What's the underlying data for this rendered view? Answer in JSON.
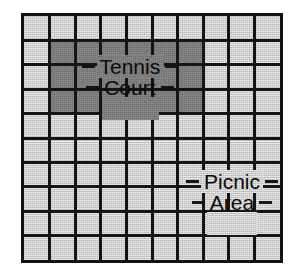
{
  "figure": {
    "kind": "grid-map",
    "background_color": "#ffffff",
    "frame": {
      "x": 21,
      "y": 13,
      "width": 262,
      "height": 250,
      "border_color": "#121212",
      "border_width": 3
    }
  },
  "grid": {
    "columns": 10,
    "rows": 10,
    "cell_width": 25.6,
    "cell_height": 24.4,
    "line_color": "#141414",
    "line_width": 3,
    "cell_colors": {
      "light": "#cdcdcd",
      "dark": "#7c7c7c"
    }
  },
  "regions": [
    {
      "id": "tennis-court",
      "name": "Tennis Court",
      "shade": "dark",
      "fill_color": "#7c7c7c",
      "col_start": 2,
      "col_end": 7,
      "row_start": 2,
      "row_end": 4,
      "cols_spanned": 6,
      "rows_spanned": 3,
      "cell_count": 18
    }
  ],
  "labels": [
    {
      "id": "tennis-court-label",
      "lines": [
        "Tennis",
        "Court"
      ],
      "line1": "Tennis",
      "line2": "Court",
      "text_color": "#0a0a0a",
      "font_size_px": 21,
      "center_x": 130,
      "center_y": 77,
      "on_shade": "dark",
      "leader_left": true,
      "leader_right": true
    },
    {
      "id": "picnic-area-label",
      "lines": [
        "Picnic",
        "Area"
      ],
      "line1": "Picnic",
      "line2": "Area",
      "text_color": "#0a0a0a",
      "font_size_px": 21,
      "center_x": 232,
      "center_y": 192,
      "on_shade": "light",
      "leader_left": true,
      "leader_right": true
    }
  ],
  "legend_note": ""
}
